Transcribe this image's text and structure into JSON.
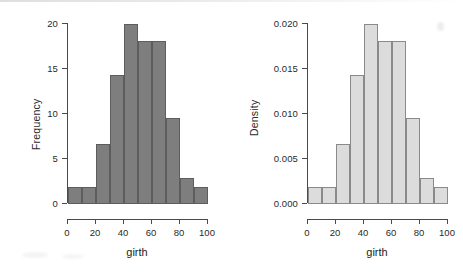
{
  "figure": {
    "background_color": "#ffffff",
    "panel_count": 2
  },
  "chart_data": [
    {
      "type": "bar",
      "title": "",
      "subtitle": "",
      "panel": "left",
      "histogram": true,
      "xlabel": "girth",
      "ylabel": "Frequency",
      "bin_edges": [
        0,
        10,
        20,
        30,
        40,
        50,
        60,
        70,
        80,
        90,
        100
      ],
      "bin_width": 10,
      "categories": [
        "0-10",
        "10-20",
        "20-30",
        "30-40",
        "40-50",
        "50-60",
        "60-70",
        "70-80",
        "80-90",
        "90-100"
      ],
      "values": [
        2,
        2,
        7,
        15,
        21,
        19,
        19,
        10,
        3,
        2
      ],
      "xlim": [
        0,
        100
      ],
      "ylim": [
        0,
        21
      ],
      "xticks": [
        0,
        20,
        40,
        60,
        80,
        100
      ],
      "xtick_labels": [
        "0",
        "20",
        "40",
        "60",
        "80",
        "100"
      ],
      "yticks": [
        0,
        5,
        10,
        15,
        20
      ],
      "ytick_labels": [
        "0",
        "5",
        "10",
        "15",
        "20"
      ],
      "bar_fill": "#7e7e7e",
      "bar_edge": "#5d5d5d",
      "grid": false,
      "legend": null
    },
    {
      "type": "bar",
      "title": "",
      "subtitle": "",
      "panel": "right",
      "histogram": true,
      "xlabel": "girth",
      "ylabel": "Density",
      "bin_edges": [
        0,
        10,
        20,
        30,
        40,
        50,
        60,
        70,
        80,
        90,
        100
      ],
      "bin_width": 10,
      "categories": [
        "0-10",
        "10-20",
        "20-30",
        "30-40",
        "40-50",
        "50-60",
        "60-70",
        "70-80",
        "80-90",
        "90-100"
      ],
      "values": [
        0.002,
        0.002,
        0.007,
        0.015,
        0.021,
        0.019,
        0.019,
        0.01,
        0.003,
        0.002
      ],
      "xlim": [
        0,
        100
      ],
      "ylim": [
        0,
        0.021
      ],
      "xticks": [
        0,
        20,
        40,
        60,
        80,
        100
      ],
      "xtick_labels": [
        "0",
        "20",
        "40",
        "60",
        "80",
        "100"
      ],
      "yticks": [
        0.0,
        0.005,
        0.01,
        0.015,
        0.02
      ],
      "ytick_labels": [
        "0.000",
        "0.005",
        "0.010",
        "0.015",
        "0.020"
      ],
      "bar_fill": "#dcdcdc",
      "bar_edge": "#8a8a8a",
      "grid": false,
      "legend": null
    }
  ]
}
